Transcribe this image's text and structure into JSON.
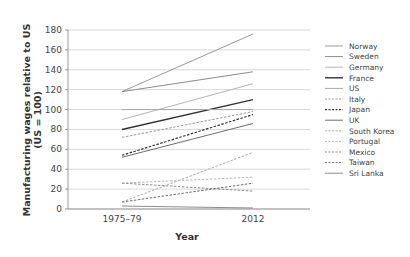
{
  "chart_data": {
    "type": "line",
    "title": "",
    "xlabel": "Year",
    "ylabel": "Manufacturing wages relative to US (US = 100)",
    "ylabel_lines": [
      "Manufacturing wages relative to US",
      "(US = 100)"
    ],
    "categories": [
      "1975–79",
      "2012"
    ],
    "ylim": [
      0,
      180
    ],
    "yticks": [
      0,
      20,
      40,
      60,
      80,
      100,
      120,
      140,
      160,
      180
    ],
    "grid": true,
    "legend_position": "right",
    "series": [
      {
        "name": "Norway",
        "values": [
          118,
          176
        ],
        "color": "#9a9a9a",
        "dash": false,
        "width": 1
      },
      {
        "name": "Sweden",
        "values": [
          118,
          138
        ],
        "color": "#8c8c8c",
        "dash": false,
        "width": 1
      },
      {
        "name": "Germany",
        "values": [
          90,
          126
        ],
        "color": "#b5b5b5",
        "dash": false,
        "width": 1
      },
      {
        "name": "France",
        "values": [
          80,
          110
        ],
        "color": "#333333",
        "dash": false,
        "width": 1.4
      },
      {
        "name": "US",
        "values": [
          100,
          100
        ],
        "color": "#a8a8a8",
        "dash": false,
        "width": 1
      },
      {
        "name": "Italy",
        "values": [
          72,
          98
        ],
        "color": "#9a9a9a",
        "dash": true,
        "width": 1
      },
      {
        "name": "Japan",
        "values": [
          54,
          95
        ],
        "color": "#333333",
        "dash": true,
        "width": 1.2
      },
      {
        "name": "UK",
        "values": [
          52,
          86
        ],
        "color": "#6e6e6e",
        "dash": false,
        "width": 1
      },
      {
        "name": "South Korea",
        "values": [
          7,
          57
        ],
        "color": "#a8a8a8",
        "dash": true,
        "width": 1
      },
      {
        "name": "Portugal",
        "values": [
          26,
          32
        ],
        "color": "#b5b5b5",
        "dash": true,
        "width": 1
      },
      {
        "name": "Mexico",
        "values": [
          26,
          18
        ],
        "color": "#8c8c8c",
        "dash": true,
        "width": 1
      },
      {
        "name": "Taiwan",
        "values": [
          7,
          26
        ],
        "color": "#6e6e6e",
        "dash": true,
        "width": 1
      },
      {
        "name": "Sri Lanka",
        "values": [
          3,
          1
        ],
        "color": "#8c8c8c",
        "dash": false,
        "width": 1
      }
    ]
  },
  "axes": {
    "x_title": "Year",
    "y_title_line1": "Manufacturing wages relative to US",
    "y_title_line2": "(US = 100)"
  }
}
